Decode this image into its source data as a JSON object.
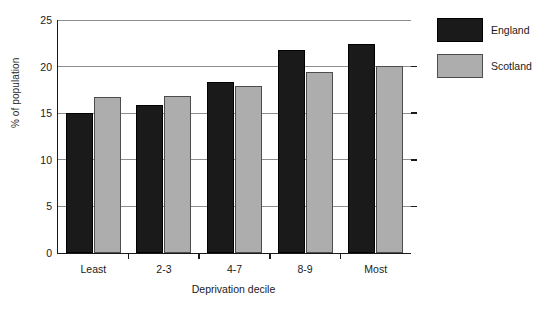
{
  "chart_data": {
    "type": "bar",
    "title": "",
    "xlabel": "Deprivation decile",
    "ylabel": "% of population",
    "categories": [
      "Least",
      "2-3",
      "4-7",
      "8-9",
      "Most"
    ],
    "series": [
      {
        "name": "England",
        "color": "#1a1a1a",
        "values": [
          15.0,
          15.9,
          18.4,
          21.8,
          22.4
        ]
      },
      {
        "name": "Scotland",
        "color": "#adadad",
        "values": [
          16.7,
          16.9,
          17.9,
          19.4,
          20.1
        ]
      }
    ],
    "ylim": [
      0,
      25
    ],
    "yticks": [
      0,
      5,
      10,
      15,
      20,
      25
    ],
    "ytick_labels": [
      "0",
      "5",
      "10",
      "15",
      "20",
      "25"
    ],
    "grid": true,
    "legend_position": "right"
  },
  "legend": {
    "items": [
      {
        "label": "England"
      },
      {
        "label": "Scotland"
      }
    ]
  }
}
